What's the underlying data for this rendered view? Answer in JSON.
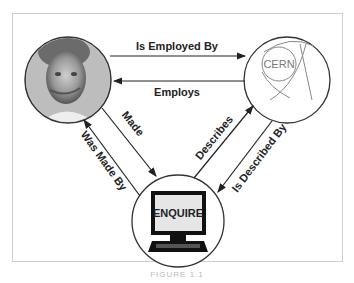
{
  "diagram": {
    "nodes": [
      {
        "id": "person",
        "label": "",
        "kind": "photo"
      },
      {
        "id": "cern",
        "label": "CERN",
        "kind": "logo"
      },
      {
        "id": "enquire",
        "label": "ENQUIRE",
        "kind": "computer"
      }
    ],
    "edges": [
      {
        "from": "person",
        "to": "cern",
        "label": "Is Employed By"
      },
      {
        "from": "cern",
        "to": "person",
        "label": "Employs"
      },
      {
        "from": "person",
        "to": "enquire",
        "label": "Made"
      },
      {
        "from": "enquire",
        "to": "person",
        "label": "Was Made By"
      },
      {
        "from": "enquire",
        "to": "cern",
        "label": "Describes"
      },
      {
        "from": "cern",
        "to": "enquire",
        "label": "Is Described By"
      }
    ],
    "caption": "FIGURE 1.1"
  }
}
